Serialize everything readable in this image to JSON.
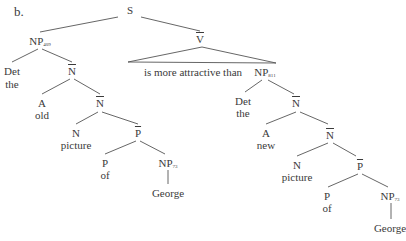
{
  "example_label": "b.",
  "tree": {
    "root": "S",
    "nodes": {
      "S": {
        "label": "S"
      },
      "NP1": {
        "label": "NP",
        "sub": "409"
      },
      "Vbar": {
        "label": "V",
        "bar": true
      },
      "Det1": {
        "label": "Det",
        "word": "the"
      },
      "N1a": {
        "label": "N",
        "bar": true
      },
      "A1": {
        "label": "A",
        "word": "old"
      },
      "N1b": {
        "label": "N",
        "bar": true
      },
      "N1": {
        "label": "N",
        "word": "picture"
      },
      "Pbar1": {
        "label": "P",
        "bar": true
      },
      "P1": {
        "label": "P",
        "word": "of"
      },
      "NP1b": {
        "label": "NP",
        "sub": "73",
        "word": "George"
      },
      "triangle_text": "is more attractive than",
      "NP2": {
        "label": "NP",
        "sub": "811"
      },
      "Det2": {
        "label": "Det",
        "word": "the"
      },
      "N2a": {
        "label": "N",
        "bar": true
      },
      "A2": {
        "label": "A",
        "word": "new"
      },
      "N2b": {
        "label": "N",
        "bar": true
      },
      "N2": {
        "label": "N",
        "word": "picture"
      },
      "Pbar2": {
        "label": "P",
        "bar": true
      },
      "P2": {
        "label": "P",
        "word": "of"
      },
      "NP2b": {
        "label": "NP",
        "sub": "73",
        "word": "George"
      }
    }
  }
}
